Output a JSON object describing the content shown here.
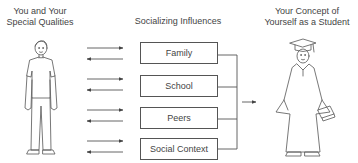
{
  "headings": {
    "left_line1": "You and Your",
    "left_line2": "Special Qualities",
    "middle": "Socializing Influences",
    "right_line1": "Your Concept of",
    "right_line2": "Yourself as a Student"
  },
  "influences": [
    {
      "label": "Family"
    },
    {
      "label": "School"
    },
    {
      "label": "Peers"
    },
    {
      "label": "Social Context"
    }
  ],
  "illustrations": {
    "left": "standing-person-icon",
    "right": "graduate-in-cap-and-gown-icon"
  },
  "colors": {
    "line": "#555555",
    "text": "#444444",
    "background": "#ffffff"
  }
}
